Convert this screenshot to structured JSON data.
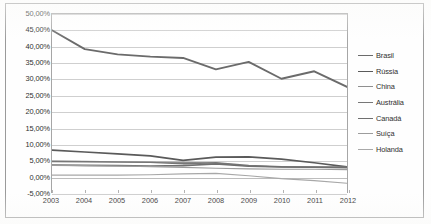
{
  "chart_data": {
    "type": "line",
    "title": "",
    "subtitle": "",
    "xlabel": "",
    "ylabel": "",
    "x": [
      2003,
      2004,
      2005,
      2006,
      2007,
      2008,
      2009,
      2010,
      2011,
      2012
    ],
    "xtick_labels": [
      "2003",
      "2004",
      "2005",
      "2006",
      "2007",
      "2008",
      "2009",
      "2010",
      "2011",
      "2012"
    ],
    "ylim": [
      -5,
      50
    ],
    "ytick_values": [
      50,
      45,
      40,
      35,
      30,
      25,
      20,
      15,
      10,
      5,
      0,
      -5
    ],
    "ytick_labels": [
      "50,00%",
      "45,00%",
      "40,00%",
      "35,00%",
      "30,00%",
      "25,00%",
      "20,00%",
      "15,00%",
      "10,00%",
      "5,00%",
      "0,00%",
      "-5,00%"
    ],
    "grid": true,
    "legend_position": "right",
    "series": [
      {
        "name": "Brasil",
        "color": "#6b6b6b",
        "width": 1.9,
        "values": [
          45.0,
          39.2,
          37.6,
          36.9,
          36.5,
          33.0,
          35.3,
          30.1,
          32.4,
          27.6
        ]
      },
      {
        "name": "Rússia",
        "color": "#5a5a5a",
        "width": 1.7,
        "values": [
          8.2,
          7.6,
          7.0,
          6.4,
          5.0,
          6.0,
          6.1,
          5.4,
          4.3,
          3.0
        ]
      },
      {
        "name": "China",
        "color": "#8f8f8f",
        "width": 1.2,
        "values": [
          4.8,
          4.7,
          4.6,
          4.5,
          4.4,
          4.2,
          3.3,
          3.0,
          2.9,
          2.9
        ]
      },
      {
        "name": "Austrália",
        "color": "#777777",
        "width": 1.4,
        "values": [
          4.7,
          4.6,
          4.5,
          4.4,
          4.0,
          4.3,
          3.5,
          3.1,
          3.0,
          2.9
        ]
      },
      {
        "name": "Canadá",
        "color": "#6f6f6f",
        "width": 1.6,
        "values": [
          3.6,
          3.5,
          3.4,
          3.3,
          3.4,
          3.9,
          3.2,
          3.0,
          2.9,
          2.8
        ]
      },
      {
        "name": "Suíça",
        "color": "#9c9c9c",
        "width": 1.2,
        "values": [
          3.5,
          3.4,
          3.3,
          3.1,
          2.9,
          2.6,
          2.4,
          2.3,
          2.3,
          2.2
        ]
      },
      {
        "name": "Holanda",
        "color": "#a8a8a8",
        "width": 1.2,
        "values": [
          0.5,
          0.5,
          0.5,
          0.6,
          0.9,
          1.0,
          0.3,
          -0.6,
          -1.2,
          -2.0
        ]
      }
    ]
  }
}
